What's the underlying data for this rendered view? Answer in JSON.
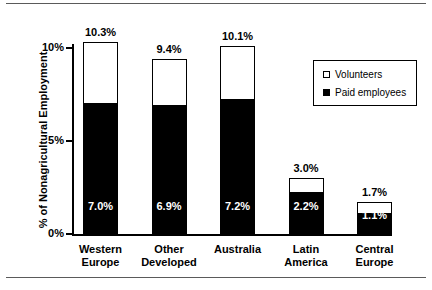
{
  "chart_data": {
    "type": "bar",
    "subtype": "stacked-column",
    "title": "",
    "xlabel": "",
    "ylabel": "% of Nonagricultural Employment",
    "ylim": [
      0,
      11
    ],
    "ytick_labels": [
      "0%",
      "5%",
      "10%"
    ],
    "ytick_values": [
      0,
      5,
      10
    ],
    "grid": false,
    "legend_position": "top-right",
    "categories": [
      "Western Europe",
      "Other Developed",
      "Australia",
      "Latin America",
      "Central Europe"
    ],
    "category_lines": [
      [
        "Western",
        "Europe"
      ],
      [
        "Other",
        "Developed"
      ],
      [
        "Australia",
        ""
      ],
      [
        "Latin",
        "America"
      ],
      [
        "Central",
        "Europe"
      ]
    ],
    "series": [
      {
        "name": "Paid employees",
        "color": "#000000",
        "values": [
          7.0,
          6.9,
          7.2,
          2.2,
          1.1
        ],
        "labels": [
          "7.0%",
          "6.9%",
          "7.2%",
          "2.2%",
          "1.1%"
        ]
      },
      {
        "name": "Volunteers",
        "color": "#ffffff",
        "values": [
          3.3,
          2.5,
          2.9,
          0.8,
          0.6
        ],
        "labels": [
          "",
          "",
          "",
          "",
          ""
        ]
      }
    ],
    "totals": [
      10.3,
      9.4,
      10.1,
      3.0,
      1.7
    ],
    "total_labels": [
      "10.3%",
      "9.4%",
      "10.1%",
      "3.0%",
      "1.7%"
    ]
  },
  "legend": {
    "items": [
      {
        "label": "Volunteers",
        "marker": "open-square",
        "color": "#ffffff"
      },
      {
        "label": "Paid employees",
        "marker": "filled-square",
        "color": "#000000"
      }
    ]
  }
}
